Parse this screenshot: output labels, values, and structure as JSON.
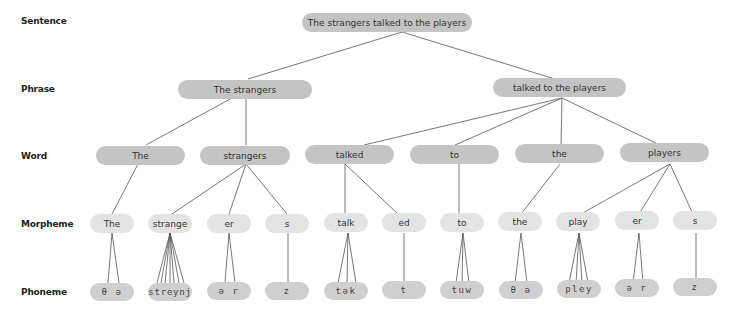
{
  "levels": [
    {
      "label": "Sentence",
      "y": 22
    },
    {
      "label": "Phrase",
      "y": 90
    },
    {
      "label": "Word",
      "y": 157
    },
    {
      "label": "Morpheme",
      "y": 225
    },
    {
      "label": "Phoneme",
      "y": 293
    }
  ],
  "sentence": {
    "text": "The strangers talked to the players"
  },
  "phrases": [
    {
      "text": "The strangers"
    },
    {
      "text": "talked to the players"
    }
  ],
  "words": [
    {
      "text": "The"
    },
    {
      "text": "strangers"
    },
    {
      "text": "talked"
    },
    {
      "text": "to"
    },
    {
      "text": "the"
    },
    {
      "text": "players"
    }
  ],
  "morphemes": [
    {
      "text": "The"
    },
    {
      "text": "strange"
    },
    {
      "text": "er"
    },
    {
      "text": "s"
    },
    {
      "text": "talk"
    },
    {
      "text": "ed"
    },
    {
      "text": "to"
    },
    {
      "text": "the"
    },
    {
      "text": "play"
    },
    {
      "text": "er"
    },
    {
      "text": "s"
    }
  ],
  "phonemes": [
    {
      "text": "θ ə"
    },
    {
      "text": "streynj"
    },
    {
      "text": "ə r"
    },
    {
      "text": "z"
    },
    {
      "text": "tək"
    },
    {
      "text": "t"
    },
    {
      "text": "tuw"
    },
    {
      "text": "θ ə"
    },
    {
      "text": "pley"
    },
    {
      "text": "ə r"
    },
    {
      "text": "z"
    }
  ],
  "colors": {
    "upper_node_fill": "#c4c4c4",
    "morpheme_fill": "#e3e3e3",
    "phoneme_fill": "#cfcfcf",
    "connector": "#555555"
  }
}
